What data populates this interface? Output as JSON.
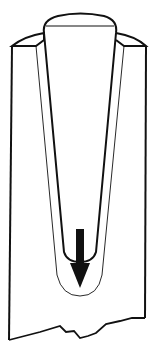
{
  "diagram": {
    "colors": {
      "background": "#ffffff",
      "line": "#111111",
      "arrow": "#111111"
    },
    "elements": [
      {
        "name": "socket-body",
        "label": ""
      },
      {
        "name": "tapered-stem",
        "label": ""
      },
      {
        "name": "downward-arrow-icon",
        "label": ""
      },
      {
        "name": "broken-edge",
        "label": ""
      }
    ]
  }
}
